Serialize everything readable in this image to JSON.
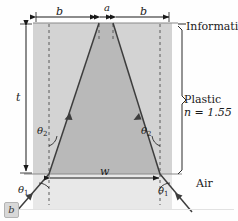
{
  "figure": {
    "panel_label": "b",
    "caption_labels": {
      "width_top_left": "b",
      "aperture_top": "a",
      "width_top_right": "b",
      "thickness": "t",
      "beam_width_bottom": "w"
    },
    "angles": {
      "theta2_left": "θ",
      "theta2_left_sub": "2",
      "theta2_right": "θ",
      "theta2_right_sub": "2",
      "theta1_left": "θ",
      "theta1_left_sub": "1",
      "theta1_right": "θ",
      "theta1_right_sub": "1"
    },
    "region_labels": {
      "information_layer": "Information layer",
      "plastic": "Plastic",
      "refractive_index": "n = 1.55",
      "air": "Air"
    },
    "colors": {
      "plastic_fill": "#d3d3d3",
      "cone_fill": "#b9b9b9",
      "air_fill": "#e8e8e8",
      "ray_stroke": "#3d3d3d",
      "dash_stroke": "#5a5a5a",
      "dimension_stroke": "#1a1a1a",
      "background": "#fefefe"
    },
    "geometry": {
      "top_y": 23,
      "bottom_y": 174,
      "slab_left_x": 33,
      "slab_right_x": 172,
      "apex_left_x": 99,
      "apex_right_x": 113,
      "base_left_x": 49,
      "base_right_x": 160
    }
  }
}
